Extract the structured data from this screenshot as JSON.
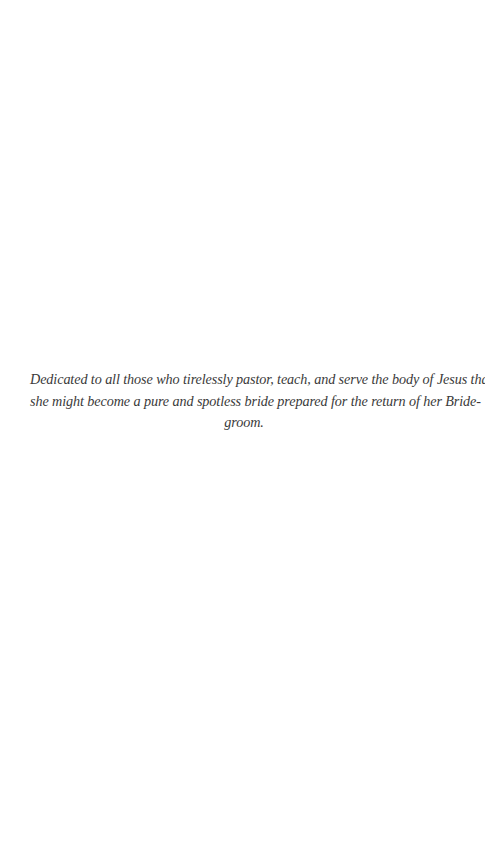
{
  "page": {
    "background": "#ffffff",
    "text_color": "#3a3a3a"
  },
  "dedication": {
    "full_text": "Dedicated to all those who tirelessly pastor, teach, and serve the body of Jesus that she might become a pure and spotless bride prepared for the return of her Bridegroom.",
    "lines": [
      "Dedicated to all those who tirelessly pastor, teach, and serve the body of  Jesus that",
      "she might become a pure and spotless bride prepared for the return of  her Bride-",
      "groom."
    ]
  }
}
